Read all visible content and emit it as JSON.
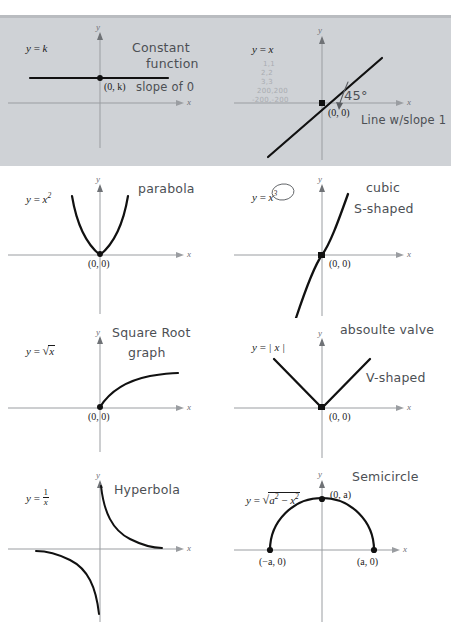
{
  "document": {
    "title": "Basic Function Graphs — Annotated Worksheet",
    "rule_count": 2
  },
  "panels": [
    {
      "id": "constant-function",
      "equation_label": "y = k",
      "point_labels": [
        "(0, k)"
      ],
      "axis_x_label": "x",
      "axis_y_label": "y",
      "annotations": [
        "Constant",
        "function",
        "slope of 0"
      ],
      "curve_type": "horizontal-line"
    },
    {
      "id": "identity-line",
      "equation_label": "y = x",
      "point_labels": [
        "(0, 0)"
      ],
      "axis_x_label": "x",
      "axis_y_label": "y",
      "annotations": [
        "45°",
        "Line w/slope 1"
      ],
      "faint_notes": [
        "1,1",
        "2,2",
        "3,3",
        "200,200",
        "200,-200"
      ],
      "curve_type": "line"
    },
    {
      "id": "parabola",
      "equation_label": "y = x2",
      "point_labels": [
        "(0, 0)"
      ],
      "axis_x_label": "x",
      "axis_y_label": "y",
      "annotations": [
        "parabola"
      ],
      "curve_type": "parabola"
    },
    {
      "id": "cubic",
      "equation_label": "y = x3",
      "point_labels": [
        "(0, 0)"
      ],
      "axis_x_label": "x",
      "axis_y_label": "y",
      "annotations": [
        "cubic",
        "S-shaped"
      ],
      "curve_type": "cubic",
      "exponent_circled": true
    },
    {
      "id": "square-root",
      "equation_label": "y = sqrt(x)",
      "point_labels": [
        "(0, 0)"
      ],
      "axis_x_label": "x",
      "axis_y_label": "y",
      "annotations": [
        "Square Root",
        "graph"
      ],
      "curve_type": "sqrt"
    },
    {
      "id": "absolute-value",
      "equation_label": "y = |x|",
      "point_labels": [
        "(0, 0)"
      ],
      "axis_x_label": "x",
      "axis_y_label": "y",
      "annotations": [
        "absoulte valve",
        "V-shaped"
      ],
      "curve_type": "absolute-value"
    },
    {
      "id": "hyperbola",
      "equation_label": "y = 1/x",
      "point_labels": [],
      "axis_x_label": "x",
      "axis_y_label": "y",
      "annotations": [
        "Hyperbola"
      ],
      "curve_type": "hyperbola"
    },
    {
      "id": "semicircle",
      "equation_label": "y = sqrt(a2 - x2)",
      "point_labels": [
        "(0, a)",
        "(-a, 0)",
        "(a, 0)"
      ],
      "axis_x_label": "x",
      "axis_y_label": "y",
      "annotations": [
        "Semicircle"
      ],
      "curve_type": "semicircle"
    }
  ],
  "text": {
    "constant": {
      "eq_y": "y",
      "eq_eq": " = ",
      "eq_k": "k",
      "pt": "(0, k)",
      "hand1": "Constant",
      "hand2": "function",
      "hand3": "slope of 0"
    },
    "identity": {
      "eq_y": "y",
      "eq_eq": " = ",
      "eq_x": "x",
      "pt": "(0, 0)",
      "n1": "1,1",
      "n2": "2,2",
      "n3": "3,3",
      "n4": "200,200",
      "n5": "-200,-200",
      "deg": "45°",
      "hand1": "Line w/slope 1"
    },
    "parabola": {
      "eq_y": "y",
      "eq_eq": " = ",
      "eq_x": "x",
      "eq_sup": "2",
      "pt": "(0, 0)",
      "hand1": "parabola"
    },
    "cubic": {
      "eq_y": "y",
      "eq_eq": " = ",
      "eq_x": "x",
      "eq_sup": "3",
      "pt": "(0, 0)",
      "hand1": "cubic",
      "hand2": "S-shaped"
    },
    "sqrt": {
      "eq_y": "y",
      "eq_eq": " = ",
      "eq_sign": "√",
      "eq_body": "x",
      "pt": "(0, 0)",
      "hand1": "Square Root",
      "hand2": "graph"
    },
    "abs": {
      "eq_y": "y",
      "eq_eq": " = ",
      "eq_body": "| x |",
      "pt": "(0, 0)",
      "hand1": "absoulte valve",
      "hand2": "V-shaped"
    },
    "hyperbola": {
      "eq_y": "y",
      "eq_eq": " = ",
      "eq_num": "1",
      "eq_den": "x",
      "hand1": "Hyperbola"
    },
    "semicircle": {
      "eq_y": "y",
      "eq_eq": " = ",
      "eq_sign": "√",
      "eq_a": "a",
      "eq_a_sup": "2",
      "eq_minus": " − ",
      "eq_x": "x",
      "eq_x_sup": "2",
      "pt_top": "(0, a)",
      "pt_left": "(−a, 0)",
      "pt_right": "(a, 0)",
      "hand1": "Semicircle"
    },
    "axes": {
      "x": "x",
      "y": "y"
    }
  },
  "colors": {
    "ink": "#1b1b1b",
    "axis": "#9a9da1",
    "curve": "#111111",
    "pencil": "#4c4f54",
    "pencil_faint": "#a9acb1",
    "rule": "#b9bcc0",
    "paper": "#ffffff"
  }
}
